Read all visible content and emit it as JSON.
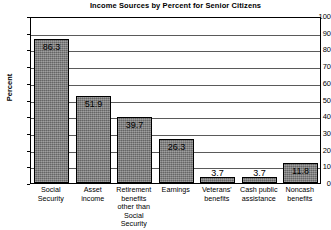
{
  "chart_data": {
    "type": "bar",
    "title": "Income Sources by Percent for Senior Citizens",
    "xlabel": "",
    "ylabel": "Percent",
    "ylim": [
      0,
      100
    ],
    "ytick_step": 10,
    "yticks": [
      "100",
      "90",
      "80",
      "70",
      "60",
      "50",
      "40",
      "30",
      "20",
      "10",
      "0"
    ],
    "grid": true,
    "legend": "none",
    "categories": [
      "Social Security",
      "Asset income",
      "Retirement benefits other than Social Security",
      "Earnings",
      "Veterans' benefits",
      "Cash public assistance",
      "Noncash benefits"
    ],
    "category_lines": [
      [
        "Social",
        "Security"
      ],
      [
        "Asset",
        "income"
      ],
      [
        "Retirement",
        "benefits",
        "other than",
        "Social Security"
      ],
      [
        "Earnings"
      ],
      [
        "Veterans'",
        "benefits"
      ],
      [
        "Cash public",
        "assistance"
      ],
      [
        "Noncash",
        "benefits"
      ]
    ],
    "values": [
      86.3,
      51.9,
      39.7,
      26.3,
      3.7,
      3.7,
      11.8
    ],
    "value_labels": [
      "86.3",
      "51.9",
      "39.7",
      "26.3",
      "3.7",
      "3.7",
      "11.8"
    ],
    "bar_color": "#7c7c7c",
    "bar_border_color": "#000000",
    "grid_color": "#5a5a5a",
    "background": "#ffffff"
  }
}
